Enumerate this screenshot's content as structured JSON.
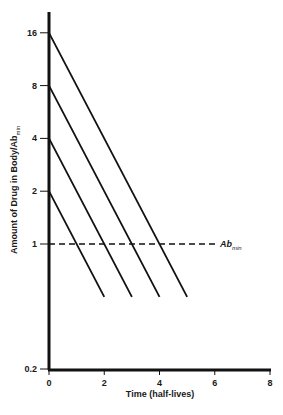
{
  "chart_data": {
    "type": "line",
    "title": "",
    "xlabel": "Time (half-lives)",
    "ylabel": "Amount of Drug in Body/Ab",
    "ylabel_subscript": "min",
    "xlim": [
      0,
      8
    ],
    "ylim": [
      0.2,
      16
    ],
    "yscale": "log",
    "x_ticks": [
      "0",
      "2",
      "4",
      "6",
      "8"
    ],
    "y_ticks": [
      "0.2",
      "1",
      "2",
      "4",
      "8",
      "16"
    ],
    "grid": false,
    "series": [
      {
        "name": "Initial 16",
        "x": [
          0,
          5
        ],
        "y": [
          16,
          0.5
        ]
      },
      {
        "name": "Initial 8",
        "x": [
          0,
          4
        ],
        "y": [
          8,
          0.5
        ]
      },
      {
        "name": "Initial 4",
        "x": [
          0,
          3
        ],
        "y": [
          4,
          0.5
        ]
      },
      {
        "name": "Initial 2",
        "x": [
          0,
          2
        ],
        "y": [
          2,
          0.5
        ]
      }
    ],
    "reference_line": {
      "label": "Ab",
      "subscript": "min",
      "y": 1,
      "style": "dashed"
    }
  }
}
